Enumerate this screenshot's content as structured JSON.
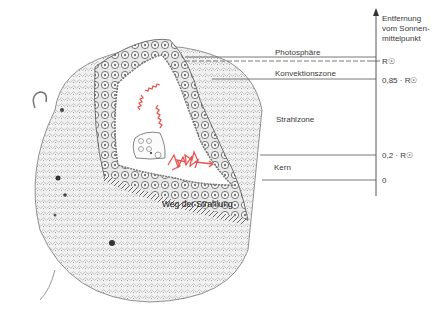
{
  "diagram": {
    "axis": {
      "title_lines": [
        "Entfernung",
        "vom Sonnen-",
        "mittelpunkt"
      ],
      "ticks": [
        {
          "label": "R☉",
          "value": 1.0
        },
        {
          "label": "0,85 · R☉",
          "value": 0.85
        },
        {
          "label": "0,2 · R☉",
          "value": 0.2
        },
        {
          "label": "0",
          "value": 0
        }
      ]
    },
    "zones": [
      {
        "name": "Photosphäre"
      },
      {
        "name": "Konvektionszone"
      },
      {
        "name": "Strahlzone"
      },
      {
        "name": "Kern"
      }
    ],
    "annotations": {
      "radiation_path": "Weg der Strahlung"
    },
    "colors": {
      "radiation": "#e8544e",
      "lines": "#444444",
      "sun_surface": "#d9d9d9"
    }
  }
}
